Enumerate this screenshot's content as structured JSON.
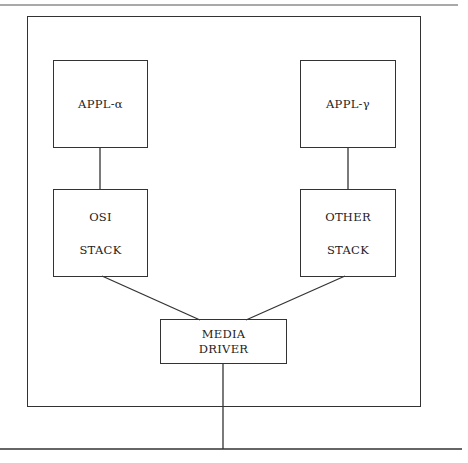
{
  "diagram": {
    "nodes": {
      "appl_alpha": {
        "label": "APPL-α"
      },
      "appl_gamma": {
        "label": "APPL-γ"
      },
      "osi_stack": {
        "line1": "OSI",
        "line2": "STACK"
      },
      "other_stack": {
        "line1": "OTHER",
        "line2": "STACK"
      },
      "media_driver": {
        "line1": "MEDIA",
        "line2": "DRIVER"
      }
    },
    "edges": [
      {
        "from": "appl_alpha",
        "to": "osi_stack"
      },
      {
        "from": "appl_gamma",
        "to": "other_stack"
      },
      {
        "from": "osi_stack",
        "to": "media_driver"
      },
      {
        "from": "other_stack",
        "to": "media_driver"
      },
      {
        "from": "media_driver",
        "to": "network_bus"
      }
    ],
    "colors": {
      "line": "#333333",
      "background": "#ffffff"
    }
  }
}
